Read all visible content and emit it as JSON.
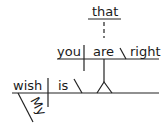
{
  "diagram": {
    "type": "sentence-diagram",
    "sentence_words": {
      "main_subject": "wish",
      "main_verb": "is",
      "modifier": "My",
      "clause_connector": "that",
      "clause_subject": "you",
      "clause_verb": "are",
      "clause_complement": "right"
    },
    "colors": {
      "line": "#222222",
      "text": "#1a1a1a",
      "background": "#ffffff"
    }
  }
}
